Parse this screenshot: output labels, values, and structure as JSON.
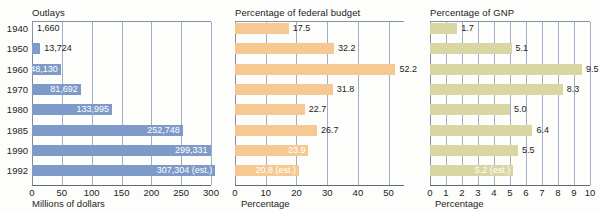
{
  "chart_data": {
    "type": "bar",
    "title": "",
    "orientation": "horizontal",
    "categories": [
      "1940",
      "1950",
      "1960",
      "1970",
      "1980",
      "1985",
      "1990",
      "1992"
    ],
    "panels": [
      {
        "id": "outlays",
        "title": "Outlays",
        "xlabel": "Millions of dollars",
        "xlim": [
          0,
          300
        ],
        "ticks": [
          "0",
          "50",
          "100",
          "150",
          "200",
          "250",
          "300"
        ],
        "tick_values": [
          0,
          50,
          100,
          150,
          200,
          250,
          300
        ],
        "grid": true,
        "color": "#7e9ac8",
        "values": [
          1660,
          13724,
          48130,
          81692,
          133995,
          252748,
          299331,
          307304
        ],
        "scale_divisor": 1000,
        "labels": [
          "1,660",
          "13,724",
          "48,130",
          "81,692",
          "133,995",
          "252,748",
          "299,331",
          "307,304 (est.)"
        ],
        "label_placement": [
          "outside",
          "outside",
          "inside",
          "inside",
          "inside",
          "inside",
          "inside",
          "inside"
        ]
      },
      {
        "id": "budget",
        "title": "Percentage of federal budget",
        "xlabel": "Percentage",
        "xlim": [
          0,
          55
        ],
        "ticks": [
          "0",
          "10",
          "20",
          "30",
          "40",
          "50"
        ],
        "tick_values": [
          0,
          10,
          20,
          30,
          40,
          50
        ],
        "grid": true,
        "color": "#f6c992",
        "values": [
          17.5,
          32.2,
          52.2,
          31.8,
          22.7,
          26.7,
          23.9,
          20.8
        ],
        "labels": [
          "17.5",
          "32.2",
          "52.2",
          "31.8",
          "22.7",
          "26.7",
          "23.9",
          "20.8 (est.)"
        ],
        "label_placement": [
          "outside",
          "outside",
          "outside",
          "outside",
          "outside",
          "outside",
          "inside",
          "inside"
        ]
      },
      {
        "id": "gnp",
        "title": "Percentage of GNP",
        "xlabel": "Percentage",
        "xlim": [
          0,
          10
        ],
        "ticks": [
          "0",
          "1",
          "2",
          "3",
          "4",
          "5",
          "6",
          "7",
          "8",
          "9",
          "10"
        ],
        "tick_values": [
          0,
          1,
          2,
          3,
          4,
          5,
          6,
          7,
          8,
          9,
          10
        ],
        "grid": true,
        "color": "#d9d6a3",
        "values": [
          1.7,
          5.1,
          9.5,
          8.3,
          5.0,
          6.4,
          5.5,
          5.2
        ],
        "labels": [
          "1.7",
          "5.1",
          "9.5",
          "8.3",
          "5.0",
          "6.4",
          "5.5",
          "5.2 (est.)"
        ],
        "label_placement": [
          "outside",
          "outside",
          "outside",
          "outside",
          "outside",
          "outside",
          "outside",
          "inside"
        ]
      }
    ]
  },
  "colors": {
    "background": "#fdfdfb",
    "blue": "#7e9ac8",
    "orange": "#f6c992",
    "olive": "#d9d6a3",
    "gridline": "#7d96b8",
    "axis": "#5d6b7d",
    "text": "#1c1c1c"
  }
}
